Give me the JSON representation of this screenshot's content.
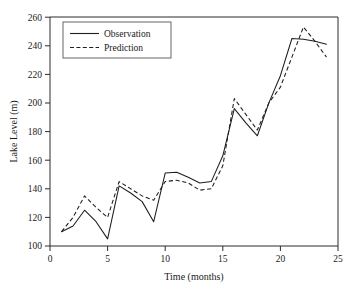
{
  "chart_data": {
    "type": "line",
    "title": "",
    "subtitle": "",
    "xlabel": "Time (months)",
    "ylabel": "Lake Level (m)",
    "xlim": [
      0,
      25
    ],
    "ylim": [
      100,
      260
    ],
    "xticks": [
      0,
      5,
      10,
      15,
      20,
      25
    ],
    "yticks": [
      100,
      120,
      140,
      160,
      180,
      200,
      220,
      240,
      260
    ],
    "grid": false,
    "legend_position": "upper-left",
    "x": [
      1,
      2,
      3,
      4,
      5,
      6,
      7,
      8,
      9,
      10,
      11,
      12,
      13,
      14,
      15,
      16,
      17,
      18,
      19,
      20,
      21,
      22,
      23,
      24
    ],
    "series": [
      {
        "name": "Observation",
        "style": "solid",
        "values": [
          110,
          114,
          125,
          117,
          105,
          142,
          137,
          131,
          117,
          151,
          151.5,
          148,
          144,
          145,
          163,
          196,
          186,
          177,
          200,
          219,
          245,
          244.5,
          243,
          241
        ]
      },
      {
        "name": "Prediction",
        "style": "dashed",
        "values": [
          110,
          120,
          135,
          127,
          120,
          145,
          140,
          135,
          132,
          145,
          146,
          144,
          139,
          140,
          156,
          203,
          192,
          181,
          200,
          211,
          232,
          253,
          243,
          232
        ]
      }
    ]
  },
  "axes": {
    "x_tick_labels": [
      "0",
      "5",
      "10",
      "15",
      "20",
      "25"
    ],
    "y_tick_labels": [
      "100",
      "120",
      "140",
      "160",
      "180",
      "200",
      "220",
      "240",
      "260"
    ],
    "x_axis_title": "Time (months)",
    "y_axis_title": "Lake Level (m)"
  },
  "legend": {
    "entries": [
      {
        "label": "Observation",
        "style": "solid"
      },
      {
        "label": "Prediction",
        "style": "dashed"
      }
    ]
  },
  "colors": {
    "line": "#1d1d1d",
    "axis": "#2b2b2b",
    "background": "#ffffff",
    "legend_border": "#555555"
  }
}
